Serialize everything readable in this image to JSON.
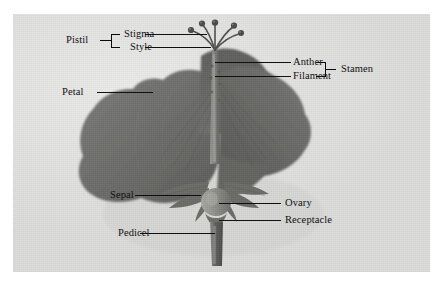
{
  "figure": {
    "kind": "botanical-photograph",
    "background_color": "#e2e2e1",
    "line_color": "#0b0b0b",
    "text_color": "#111111"
  },
  "labels": {
    "pistil": "Pistil",
    "stigma": "Stigma",
    "style": "Style",
    "anther": "Anther",
    "filament": "Filament",
    "stamen": "Stamen",
    "petal": "Petal",
    "sepal": "Sepal",
    "ovary": "Ovary",
    "receptacle": "Receptacle",
    "pedicel": "Pedicel"
  },
  "groups": [
    {
      "name": "pistil",
      "label": "Pistil",
      "members": [
        "Stigma",
        "Style"
      ],
      "bracket": "left"
    },
    {
      "name": "stamen",
      "label": "Stamen",
      "members": [
        "Anther",
        "Filament"
      ],
      "bracket": "right"
    }
  ],
  "callouts": [
    {
      "name": "stigma",
      "label": "Stigma",
      "side": "left"
    },
    {
      "name": "style",
      "label": "Style",
      "side": "left"
    },
    {
      "name": "anther",
      "label": "Anther",
      "side": "right"
    },
    {
      "name": "filament",
      "label": "Filament",
      "side": "right"
    },
    {
      "name": "petal",
      "label": "Petal",
      "side": "left"
    },
    {
      "name": "sepal",
      "label": "Sepal",
      "side": "left"
    },
    {
      "name": "ovary",
      "label": "Ovary",
      "side": "right"
    },
    {
      "name": "receptacle",
      "label": "Receptacle",
      "side": "right"
    },
    {
      "name": "pedicel",
      "label": "Pedicel",
      "side": "left"
    }
  ]
}
